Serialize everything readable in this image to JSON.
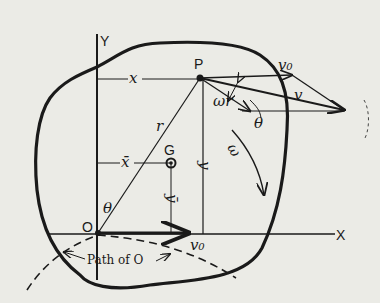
{
  "diagram": {
    "type": "rigid-body-kinematics",
    "labels": {
      "y_axis": "Y",
      "x_axis": "X",
      "point_p": "P",
      "point_g": "G",
      "origin": "O",
      "x": "x",
      "x_bar": "x̄",
      "y": "y",
      "y_bar": "ȳ",
      "r": "r",
      "theta_origin": "θ",
      "theta_velocity": "θ",
      "omega": "ω",
      "omega_r": "ωr",
      "v": "v",
      "v0_top": "v₀",
      "v0_bottom": "v₀",
      "path_label": "Path of O"
    },
    "colors": {
      "ink": "#1a1a1a",
      "paper": "#ebebe6"
    }
  }
}
